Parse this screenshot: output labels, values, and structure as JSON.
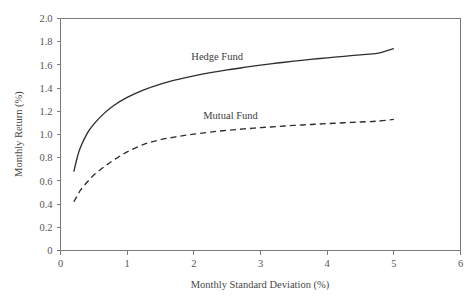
{
  "chart_data": {
    "type": "line",
    "title": "",
    "xlabel": "Monthly Standard Deviation (%)",
    "ylabel": "Monthly Return (%)",
    "xlim": [
      0,
      6
    ],
    "ylim": [
      0,
      2.0
    ],
    "grid": false,
    "legend_position": "inline-annotation",
    "xticks": [
      "0",
      "1",
      "2",
      "3",
      "4",
      "5",
      "6"
    ],
    "xtick_values": [
      0,
      1,
      2,
      3,
      4,
      5,
      6
    ],
    "yticks": [
      "0",
      "0.2",
      "0.4",
      "0.6",
      "0.8",
      "1.0",
      "1.2",
      "1.4",
      "1.6",
      "1.8",
      "2.0"
    ],
    "ytick_values": [
      0,
      0.2,
      0.4,
      0.6,
      0.8,
      1.0,
      1.2,
      1.4,
      1.6,
      1.8,
      2.0
    ],
    "series": [
      {
        "name": "Hedge Fund",
        "style": "solid",
        "color": "#2e2e2e",
        "x": [
          0.2,
          0.25,
          0.3,
          0.4,
          0.5,
          0.65,
          0.8,
          1.0,
          1.25,
          1.5,
          1.75,
          2.0,
          2.25,
          2.5,
          2.75,
          3.0,
          3.25,
          3.5,
          3.75,
          4.0,
          4.25,
          4.5,
          4.75,
          5.0
        ],
        "y": [
          0.68,
          0.8,
          0.89,
          1.01,
          1.09,
          1.18,
          1.25,
          1.32,
          1.385,
          1.435,
          1.473,
          1.505,
          1.533,
          1.557,
          1.578,
          1.598,
          1.616,
          1.632,
          1.647,
          1.661,
          1.674,
          1.687,
          1.699,
          1.74
        ]
      },
      {
        "name": "Mutual Fund",
        "style": "dashed",
        "color": "#2e2e2e",
        "x": [
          0.2,
          0.25,
          0.3,
          0.4,
          0.5,
          0.65,
          0.8,
          1.0,
          1.25,
          1.5,
          1.75,
          2.0,
          2.25,
          2.5,
          2.75,
          3.0,
          3.25,
          3.5,
          3.75,
          4.0,
          4.25,
          4.5,
          4.75,
          5.0
        ],
        "y": [
          0.42,
          0.47,
          0.52,
          0.59,
          0.65,
          0.72,
          0.78,
          0.85,
          0.915,
          0.955,
          0.982,
          1.003,
          1.021,
          1.036,
          1.048,
          1.059,
          1.069,
          1.078,
          1.086,
          1.094,
          1.101,
          1.108,
          1.115,
          1.13
        ]
      }
    ],
    "annotations": [
      {
        "text": "Hedge Fund",
        "x": 2.35,
        "y": 1.645
      },
      {
        "text": "Mutual Fund",
        "x": 2.55,
        "y": 1.135
      }
    ]
  }
}
